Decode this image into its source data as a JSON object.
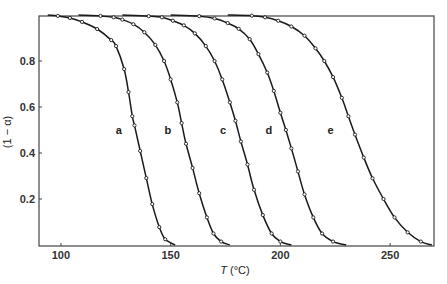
{
  "chart_data": {
    "type": "line",
    "title": "",
    "xlabel": "T (°C)",
    "xlabel_italic_part": "T",
    "xlabel_rest": " (°C)",
    "ylabel": "(1 − α)",
    "xlim": [
      90,
      270
    ],
    "ylim": [
      0,
      1.0
    ],
    "xticks": [
      100,
      150,
      200,
      250
    ],
    "xtick_labels": [
      "100",
      "150",
      "200",
      "250"
    ],
    "yticks": [
      0.2,
      0.4,
      0.6,
      0.8
    ],
    "ytick_labels": [
      "0.2",
      "0.4",
      "0.6",
      "0.8"
    ],
    "grid": false,
    "legend": "inline curve labels",
    "series": [
      {
        "name": "a",
        "label_at": [
          130.5,
          0.5
        ],
        "points": [
          [
            94,
            1.0
          ],
          [
            98.6,
            0.996
          ],
          [
            104.1,
            0.987
          ],
          [
            109.6,
            0.97
          ],
          [
            116.5,
            0.939
          ],
          [
            122.9,
            0.891
          ],
          [
            125.1,
            0.865
          ],
          [
            128.8,
            0.765
          ],
          [
            130.8,
            0.665
          ],
          [
            132.5,
            0.56
          ],
          [
            133.5,
            0.52
          ],
          [
            136.1,
            0.409
          ],
          [
            138.9,
            0.291
          ],
          [
            141.6,
            0.178
          ],
          [
            144.8,
            0.078
          ],
          [
            147.5,
            0.025
          ],
          [
            152,
            0.0
          ]
        ]
      },
      {
        "name": "b",
        "label_at": [
          153,
          0.5
        ],
        "points": [
          [
            108,
            1.0
          ],
          [
            118,
            0.996
          ],
          [
            124,
            0.99
          ],
          [
            128,
            0.98
          ],
          [
            133,
            0.96
          ],
          [
            138,
            0.925
          ],
          [
            143,
            0.87
          ],
          [
            147,
            0.8
          ],
          [
            150,
            0.72
          ],
          [
            153,
            0.62
          ],
          [
            155,
            0.53
          ],
          [
            157,
            0.44
          ],
          [
            160,
            0.335
          ],
          [
            163,
            0.225
          ],
          [
            166.5,
            0.12
          ],
          [
            169.5,
            0.05
          ],
          [
            173,
            0.015
          ],
          [
            177,
            0.0
          ]
        ]
      },
      {
        "name": "c",
        "label_at": [
          178,
          0.5
        ],
        "points": [
          [
            128,
            1.0
          ],
          [
            140,
            0.995
          ],
          [
            146,
            0.99
          ],
          [
            151,
            0.975
          ],
          [
            156,
            0.955
          ],
          [
            161,
            0.92
          ],
          [
            166,
            0.865
          ],
          [
            170,
            0.8
          ],
          [
            173.5,
            0.72
          ],
          [
            177,
            0.62
          ],
          [
            179.5,
            0.54
          ],
          [
            182,
            0.45
          ],
          [
            185,
            0.35
          ],
          [
            188,
            0.24
          ],
          [
            192,
            0.13
          ],
          [
            196,
            0.05
          ],
          [
            200,
            0.015
          ],
          [
            205,
            0.0
          ]
        ]
      },
      {
        "name": "d",
        "label_at": [
          199,
          0.5
        ],
        "points": [
          [
            150,
            1.0
          ],
          [
            163,
            0.995
          ],
          [
            170,
            0.985
          ],
          [
            176,
            0.965
          ],
          [
            181,
            0.94
          ],
          [
            186,
            0.895
          ],
          [
            190,
            0.83
          ],
          [
            194,
            0.75
          ],
          [
            197,
            0.67
          ],
          [
            200,
            0.575
          ],
          [
            202.5,
            0.5
          ],
          [
            205,
            0.42
          ],
          [
            208,
            0.32
          ],
          [
            211,
            0.22
          ],
          [
            215,
            0.12
          ],
          [
            219,
            0.05
          ],
          [
            224,
            0.015
          ],
          [
            230,
            0.0
          ]
        ]
      },
      {
        "name": "e",
        "label_at": [
          227,
          0.5
        ],
        "points": [
          [
            176,
            1.0
          ],
          [
            187,
            0.997
          ],
          [
            193,
            0.99
          ],
          [
            199,
            0.975
          ],
          [
            205,
            0.95
          ],
          [
            211,
            0.91
          ],
          [
            216,
            0.855
          ],
          [
            220,
            0.8
          ],
          [
            224,
            0.73
          ],
          [
            228,
            0.64
          ],
          [
            231,
            0.56
          ],
          [
            234,
            0.48
          ],
          [
            238,
            0.38
          ],
          [
            242,
            0.29
          ],
          [
            247,
            0.2
          ],
          [
            252,
            0.12
          ],
          [
            258,
            0.055
          ],
          [
            264,
            0.015
          ],
          [
            269,
            0.0
          ]
        ]
      }
    ]
  }
}
